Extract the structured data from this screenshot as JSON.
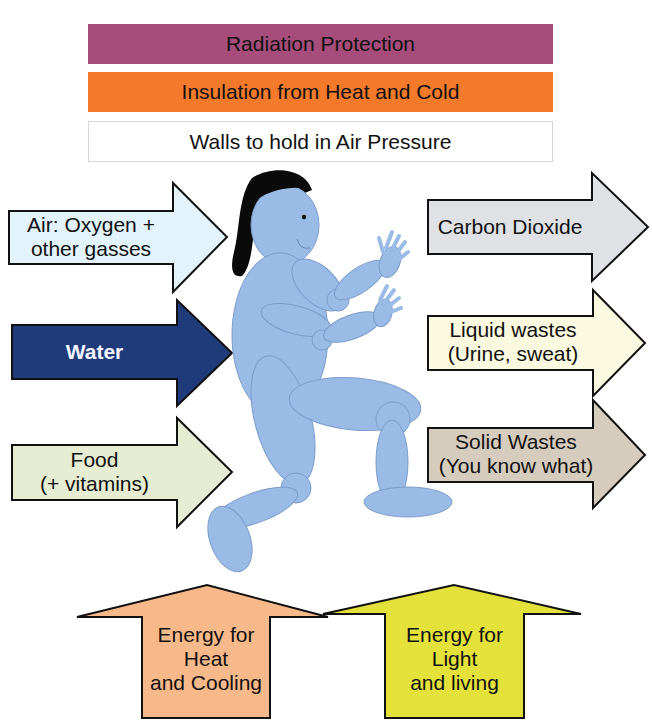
{
  "top_bars": [
    {
      "label": "Radiation Protection",
      "color": "#a64d7c"
    },
    {
      "label": "Insulation from Heat and Cold",
      "color": "#f27a2a"
    },
    {
      "label": "Walls to hold in Air Pressure",
      "color": "#ffffff"
    }
  ],
  "inputs": [
    {
      "line1": "Air: Oxygen +",
      "line2": "other gasses",
      "color": "#e3f3fb"
    },
    {
      "line1": "Water",
      "color": "#1f3b7a",
      "text_color": "#f4f6ff"
    },
    {
      "line1": "Food",
      "line2": "(+ vitamins)",
      "color": "#e6ecd2"
    }
  ],
  "outputs": [
    {
      "line1": "Carbon Dioxide",
      "color": "#dfe1e4"
    },
    {
      "line1": "Liquid wastes",
      "line2": "(Urine, sweat)",
      "color": "#fcf9e1"
    },
    {
      "line1": "Solid Wastes",
      "line2": "(You know what)",
      "color": "#d6ccbd"
    }
  ],
  "energy": [
    {
      "line1": "Energy for",
      "line2": "Heat",
      "line3": "and Cooling",
      "color": "#f8b98a"
    },
    {
      "line1": "Energy for",
      "line2": "Light",
      "line3": "and living",
      "color": "#e4e23a"
    }
  ],
  "figure": {
    "body_color": "#99bbe6",
    "hair_color": "#0a0a0a",
    "outline_color": "#7b9ccc"
  }
}
